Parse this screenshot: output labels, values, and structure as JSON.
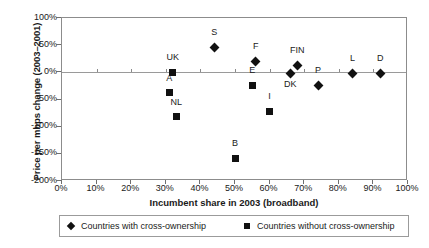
{
  "chart_data": {
    "type": "scatter",
    "title": "",
    "xlabel": "Incumbent share in 2003 (broadband)",
    "ylabel": "Price per mbps change (2003–2001)",
    "xlim": [
      0,
      100
    ],
    "ylim": [
      -200,
      100
    ],
    "grid": false,
    "xticks": [
      "0%",
      "10%",
      "20%",
      "30%",
      "40%",
      "50%",
      "60%",
      "70%",
      "80%",
      "90%",
      "100%"
    ],
    "xtick_values": [
      0,
      10,
      20,
      30,
      40,
      50,
      60,
      70,
      80,
      90,
      100
    ],
    "yticks": [
      "100%",
      "50%",
      "0%",
      "-50%",
      "-100%",
      "-150%",
      "-200%"
    ],
    "ytick_values": [
      100,
      50,
      0,
      -50,
      -100,
      -150,
      -200
    ],
    "legend_position": "bottom",
    "series": [
      {
        "name": "Countries with cross-ownership",
        "marker": "diamond",
        "color": "#111111",
        "points": [
          {
            "label": "S",
            "x": 44,
            "y": 46,
            "label_pos": "above"
          },
          {
            "label": "F",
            "x": 56,
            "y": 20,
            "label_pos": "above"
          },
          {
            "label": "FIN",
            "x": 68,
            "y": 13,
            "label_pos": "above"
          },
          {
            "label": "DK",
            "x": 66,
            "y": -2,
            "label_pos": "below"
          },
          {
            "label": "P",
            "x": 74,
            "y": -24,
            "label_pos": "above"
          },
          {
            "label": "L",
            "x": 84,
            "y": -2,
            "label_pos": "above"
          },
          {
            "label": "D",
            "x": 92,
            "y": -2,
            "label_pos": "above"
          }
        ]
      },
      {
        "name": "Countries without cross-ownership",
        "marker": "square",
        "color": "#111111",
        "points": [
          {
            "label": "UK",
            "x": 32,
            "y": 0,
            "label_pos": "above"
          },
          {
            "label": "A",
            "x": 31,
            "y": -38,
            "label_pos": "above"
          },
          {
            "label": "NL",
            "x": 33,
            "y": -82,
            "label_pos": "above"
          },
          {
            "label": "B",
            "x": 50,
            "y": -158,
            "label_pos": "above"
          },
          {
            "label": "E",
            "x": 55,
            "y": -24,
            "label_pos": "above"
          },
          {
            "label": "I",
            "x": 60,
            "y": -72,
            "label_pos": "above"
          }
        ]
      }
    ]
  },
  "legend": {
    "items": [
      {
        "label": "Countries with cross-ownership",
        "marker": "diamond"
      },
      {
        "label": "Countries without cross-ownership",
        "marker": "square"
      }
    ]
  }
}
